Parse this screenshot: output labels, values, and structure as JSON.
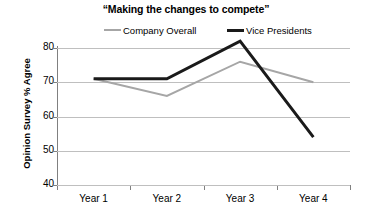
{
  "chart_data": {
    "type": "line",
    "title": "“Making the changes to compete”",
    "xlabel": "",
    "ylabel": "Opinion Survey % Agree",
    "categories": [
      "Year 1",
      "Year 2",
      "Year 3",
      "Year 4"
    ],
    "ylim": [
      40,
      80
    ],
    "yticks": [
      40,
      50,
      60,
      70,
      80
    ],
    "ytick_labels": [
      "40",
      "50",
      "60",
      "70",
      "80"
    ],
    "grid": true,
    "legend_position": "top",
    "series": [
      {
        "name": "Company Overall",
        "values": [
          71,
          66,
          76,
          70
        ],
        "color": "#a6a6a6",
        "width": 2
      },
      {
        "name": "Vice Presidents",
        "values": [
          71,
          71,
          82,
          54
        ],
        "color": "#1a1a1a",
        "width": 3
      }
    ]
  },
  "legend": {
    "items": [
      {
        "label": "Company Overall"
      },
      {
        "label": "Vice Presidents"
      }
    ]
  },
  "axes": {
    "y_title": "Opinion Survey % Agree",
    "y_labels": [
      "80",
      "70",
      "60",
      "50",
      "40"
    ],
    "x_labels": [
      "Year 1",
      "Year 2",
      "Year 3",
      "Year 4"
    ]
  }
}
